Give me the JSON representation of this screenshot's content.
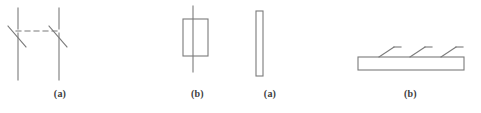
{
  "figure": {
    "background_color": "#ffffff",
    "stroke_color": "#7a7a7a",
    "caption_color": "#3d3d3d",
    "width": 481,
    "height": 113,
    "panels": [
      {
        "id": "knife-switch",
        "caption": "(a)",
        "description": "open contact pair with dashed link",
        "stroke_width": 1
      },
      {
        "id": "core-coil",
        "caption": "(b)",
        "description": "rectangle with vertical line through center",
        "stroke_width": 1
      },
      {
        "id": "plate-edge",
        "caption": "(a)",
        "description": "tall narrow vertical rectangle",
        "stroke_width": 1
      },
      {
        "id": "finned-plate",
        "caption": "(b)",
        "description": "horizontal bar with three angled fins on top",
        "stroke_width": 1
      }
    ]
  }
}
